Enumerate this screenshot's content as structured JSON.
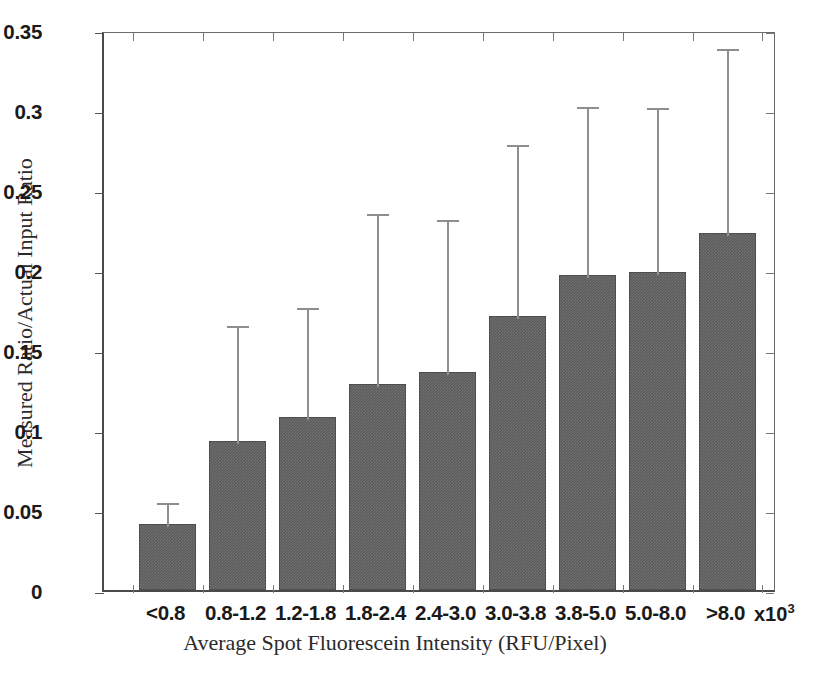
{
  "chart_data": {
    "type": "bar",
    "title": "",
    "xlabel": "Average Spot Fluorescein Intensity (RFU/Pixel)",
    "ylabel": "Measured Ratio/Actual Input Ratio",
    "x_exponent_label": "x10",
    "x_exponent_power": "3",
    "categories": [
      "<0.8",
      "0.8-1.2",
      "1.2-1.8",
      "1.8-2.4",
      "2.4-3.0",
      "3.0-3.8",
      "3.8-5.0",
      "5.0-8.0",
      ">8.0"
    ],
    "values": [
      0.041,
      0.093,
      0.108,
      0.129,
      0.136,
      0.171,
      0.197,
      0.199,
      0.223
    ],
    "error_upper": [
      0.015,
      0.074,
      0.07,
      0.108,
      0.097,
      0.109,
      0.107,
      0.104,
      0.117
    ],
    "error_top_values": [
      0.056,
      0.167,
      0.178,
      0.237,
      0.233,
      0.28,
      0.304,
      0.303,
      0.34
    ],
    "ylim": [
      0,
      0.35
    ],
    "ytick_labels": [
      "0",
      "0.05",
      "0.1",
      "0.15",
      "0.2",
      "0.25",
      "0.3",
      "0.35"
    ],
    "ytick_values": [
      0,
      0.05,
      0.1,
      0.15,
      0.2,
      0.25,
      0.3,
      0.35
    ],
    "grid": false,
    "legend": "none",
    "bar_color": "#5c5c5c",
    "error_bar_color": "#8e8e8e",
    "axis_color": "#4a4a4a",
    "error_direction": "upper-only"
  }
}
